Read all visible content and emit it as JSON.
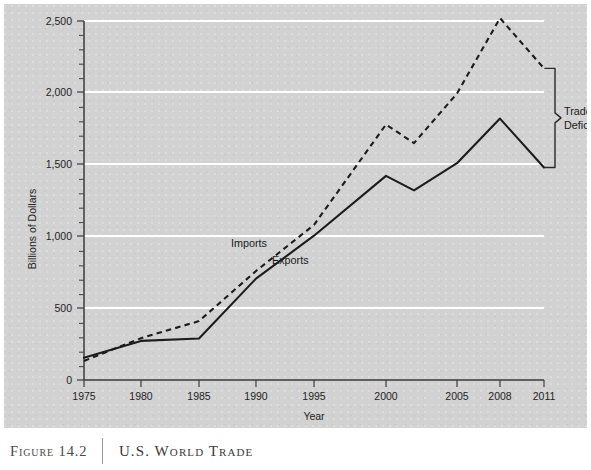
{
  "figure": {
    "number_label": "Figure 14.2",
    "title": "U.S. World Trade"
  },
  "chart_data": {
    "type": "line",
    "title": "U.S. World Trade",
    "xlabel": "Year",
    "ylabel": "Billions of Dollars",
    "ylim": [
      0,
      2500
    ],
    "yticks": [
      0,
      500,
      1000,
      1500,
      2000,
      2500
    ],
    "ytick_labels": [
      "0",
      "500",
      "1,000",
      "1,500",
      "2,000",
      "2,500"
    ],
    "minor_tick_step": 100,
    "grid": "horizontal-white",
    "legend": "inline-labels",
    "categories": [
      1975,
      1980,
      1985,
      1990,
      1995,
      2000,
      2003,
      2005,
      2008,
      2011
    ],
    "xtick_labels": [
      "1975",
      "1980",
      "1985",
      "1990",
      "1995",
      "2000",
      "2005",
      "2008",
      "2011"
    ],
    "series": [
      {
        "name": "Exports",
        "style": "solid",
        "label": "Exports",
        "values": [
          155,
          272,
          289,
          706,
          1005,
          1421,
          1320,
          1510,
          1820,
          1480
        ]
      },
      {
        "name": "Imports",
        "style": "dashed",
        "label": "Imports",
        "values": [
          133,
          291,
          410,
          759,
          1080,
          1779,
          1650,
          1995,
          2520,
          2170
        ]
      }
    ],
    "annotations": [
      {
        "name": "trade-deficits",
        "text_line_1": "Trade",
        "text_line_2": "Deficits",
        "kind": "brace",
        "spans_from_value": 2170,
        "spans_to_value": 1480,
        "at_year": 2011
      }
    ]
  },
  "colors": {
    "panel_background": "#d2d2d2",
    "gridline": "#ffffff",
    "axis": "#3b3b3b",
    "series_line": "#1c1c1c",
    "caption_text": "#3a3a3a"
  }
}
